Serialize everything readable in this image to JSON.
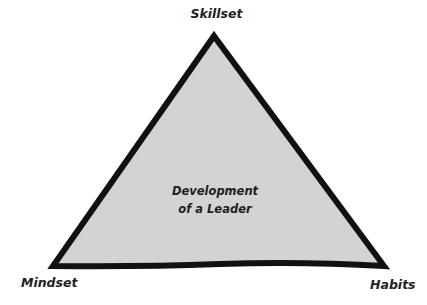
{
  "diagram": {
    "type": "triangle",
    "vertices": {
      "top": "Skillset",
      "bottom_left": "Mindset",
      "bottom_right": "Habits"
    },
    "center": {
      "line1": "Development",
      "line2": "of a Leader"
    },
    "colors": {
      "fill": "#d3d3d3",
      "stroke": "#111111",
      "text": "#222222",
      "background": "#ffffff"
    }
  }
}
